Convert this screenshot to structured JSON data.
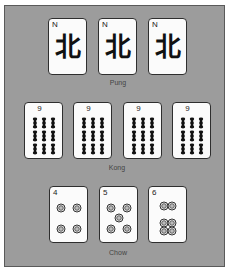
{
  "groups": {
    "pung": {
      "label": "Pung",
      "tiles": [
        {
          "index": "N",
          "suit": "wind",
          "glyph": "北"
        },
        {
          "index": "N",
          "suit": "wind",
          "glyph": "北"
        },
        {
          "index": "N",
          "suit": "wind",
          "glyph": "北"
        }
      ]
    },
    "kong": {
      "label": "Kong",
      "tiles": [
        {
          "index": "9",
          "suit": "bamboo",
          "count": 9
        },
        {
          "index": "9",
          "suit": "bamboo",
          "count": 9
        },
        {
          "index": "9",
          "suit": "bamboo",
          "count": 9
        },
        {
          "index": "9",
          "suit": "bamboo",
          "count": 9
        }
      ]
    },
    "chow": {
      "label": "Chow",
      "tiles": [
        {
          "index": "4",
          "suit": "circles",
          "count": 4
        },
        {
          "index": "5",
          "suit": "circles",
          "count": 5
        },
        {
          "index": "6",
          "suit": "circles",
          "count": 6
        }
      ]
    }
  },
  "colors": {
    "background": "#9c9c9c",
    "tile_face": "#fbfbfb",
    "tile_border": "#2e2e2e",
    "ink": "#111111"
  }
}
